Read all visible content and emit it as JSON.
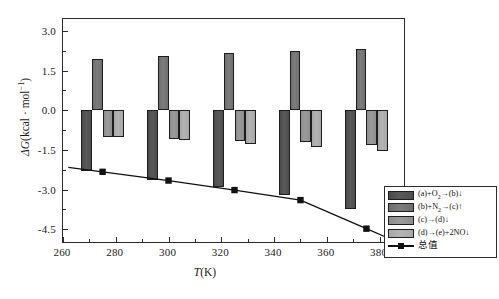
{
  "chart_data": {
    "type": "bar",
    "title": "",
    "xlabel": "T(K)",
    "ylabel": "ΔG(kcal · mol⁻¹)",
    "x": [
      275,
      300,
      325,
      350,
      375
    ],
    "xtick_labels": [
      "260",
      "280",
      "300",
      "320",
      "340",
      "360",
      "380"
    ],
    "xtick_values": [
      260,
      280,
      300,
      320,
      340,
      360,
      380
    ],
    "xlim": [
      260,
      390
    ],
    "ytick_labels": [
      "3.0",
      "1.5",
      "0.0",
      "-1.5",
      "-3.0",
      "-4.5"
    ],
    "ytick_values": [
      3.0,
      1.5,
      0.0,
      -1.5,
      -3.0,
      -4.5
    ],
    "ylim": [
      -5.06,
      3.45
    ],
    "grid": false,
    "legend_position": "bottom-right",
    "series": [
      {
        "name": "(a)+O₂→(b)↓",
        "label_html": "(a)+O<sub>2</sub>→(b)↓",
        "type": "bar",
        "color": "#555555",
        "values": [
          -2.3,
          -2.63,
          -2.9,
          -3.2,
          -3.72
        ]
      },
      {
        "name": "(b)+N₂→(c)↑",
        "label_html": "(b)+N<sub>2</sub>→(c)↑",
        "type": "bar",
        "color": "#787878",
        "values": [
          1.95,
          2.05,
          2.18,
          2.25,
          2.32
        ]
      },
      {
        "name": "(c)→(d)↓",
        "label_html": "(c)→(d)↓",
        "type": "bar",
        "color": "#959595",
        "values": [
          -1.02,
          -1.1,
          -1.17,
          -1.2,
          -1.3
        ]
      },
      {
        "name": "(d)→(e)+2NO↓",
        "label_html": "(d)→(e)+2NO↓",
        "type": "bar",
        "color": "#aeaeae",
        "values": [
          -1.0,
          -1.12,
          -1.28,
          -1.38,
          -1.55
        ]
      },
      {
        "name": "总值",
        "label_html": "总值",
        "type": "line",
        "color": "#111111",
        "marker": "square",
        "values": [
          -2.33,
          -2.66,
          -3.02,
          -3.4,
          -4.48
        ]
      }
    ]
  },
  "axis": {
    "x_title_prefix": "T",
    "x_title_suffix": "(K)",
    "y_title_prefix": "ΔG",
    "y_title_body": "(kcal · mol",
    "y_title_sup": "−1",
    "y_title_close": ")"
  },
  "legend": {
    "items": [
      {
        "label": "(a)+O2→(b)↓",
        "swatch": "#555555"
      },
      {
        "label": "(b)+N2→(c)↑",
        "swatch": "#787878"
      },
      {
        "label": "(c)→(d)↓",
        "swatch": "#959595"
      },
      {
        "label": "(d)→(e)+2NO↓",
        "swatch": "#aeaeae"
      },
      {
        "label": "总值",
        "swatch": "#111111"
      }
    ]
  }
}
